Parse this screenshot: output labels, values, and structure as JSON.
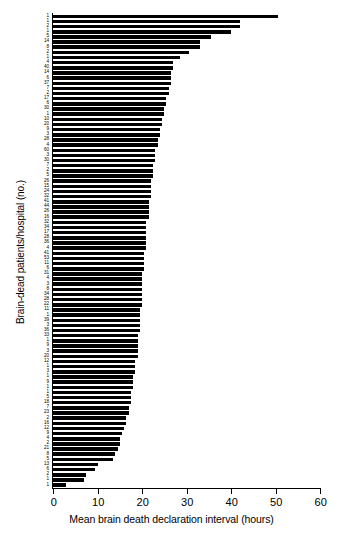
{
  "chart_data": {
    "type": "bar",
    "orientation": "horizontal",
    "title": "",
    "xlabel": "Mean brain death declaration interval (hours)",
    "ylabel": "Brain-dead patients/hospital (no.)",
    "xlim": [
      0,
      60
    ],
    "xticks": [
      0,
      10,
      20,
      30,
      40,
      50,
      60
    ],
    "xtick_labels": [
      "0",
      "10",
      "20",
      "30",
      "40",
      "50",
      "60"
    ],
    "grid": false,
    "legend": null,
    "bar_color": "#000000",
    "background_color": "#ffffff",
    "n_bars": 92,
    "note": "Each bar is one hospital; y tick label is the number of brain-dead patients at that hospital. Bars sorted by mean declaration interval, descending.",
    "categories": [
      "1",
      "1",
      "2",
      "1",
      "5",
      "14",
      "8",
      "2",
      "1",
      "4",
      "40",
      "14",
      "6",
      "37",
      "7",
      "2",
      "17",
      "6",
      "30",
      "1",
      "10",
      "20",
      "9",
      "3",
      "28",
      "4",
      "60",
      "3",
      "30",
      "7",
      "2",
      "5",
      "26",
      "15",
      "24",
      "32",
      "41",
      "44",
      "26",
      "16",
      "32",
      "34",
      "17",
      "28",
      "36",
      "4",
      "41",
      "53",
      "11",
      "6",
      "31",
      "4",
      "3",
      "8",
      "34",
      "28",
      "22",
      "11",
      "1",
      "39",
      "3",
      "36",
      "33",
      "1",
      "9",
      "3",
      "20",
      "12",
      "1",
      "3",
      "1",
      "9",
      "1",
      "1",
      "5",
      "18",
      "7",
      "23",
      "2",
      "16",
      "12",
      "9",
      "4",
      "2",
      "21",
      "8",
      "5",
      "13",
      "6",
      "2",
      "1",
      "1"
    ],
    "values": [
      50.5,
      42.0,
      42.0,
      40.0,
      35.5,
      33.0,
      33.0,
      30.5,
      28.5,
      27.0,
      27.0,
      26.5,
      26.5,
      26.5,
      26.0,
      26.0,
      25.5,
      25.5,
      25.0,
      25.0,
      24.5,
      24.5,
      24.0,
      24.0,
      23.5,
      23.5,
      23.0,
      23.0,
      23.0,
      22.5,
      22.5,
      22.5,
      22.0,
      22.0,
      22.0,
      22.0,
      21.5,
      21.5,
      21.5,
      21.5,
      21.0,
      21.0,
      21.0,
      21.0,
      21.0,
      21.0,
      20.5,
      20.5,
      20.5,
      20.5,
      20.0,
      20.0,
      20.0,
      20.0,
      20.0,
      20.0,
      20.0,
      19.5,
      19.5,
      19.5,
      19.5,
      19.5,
      19.0,
      19.0,
      19.0,
      19.0,
      19.0,
      18.5,
      18.5,
      18.5,
      18.0,
      18.0,
      18.0,
      17.5,
      17.5,
      17.5,
      17.0,
      17.0,
      16.5,
      16.5,
      16.0,
      15.5,
      15.0,
      15.0,
      14.5,
      14.0,
      13.5,
      10.0,
      9.5,
      7.5,
      7.0,
      3.0
    ]
  }
}
